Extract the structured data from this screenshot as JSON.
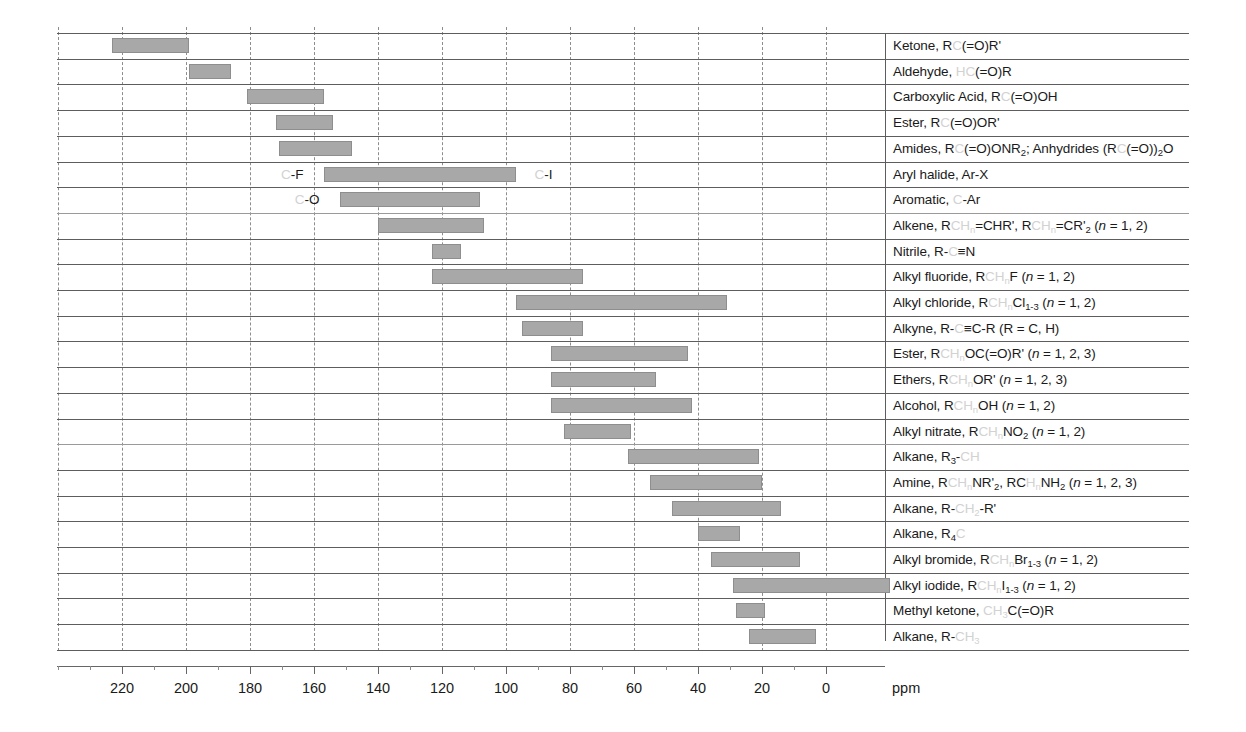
{
  "chart_data": {
    "type": "bar",
    "orientation": "horizontal-range",
    "title": "",
    "xlabel": "ppm",
    "ylabel": "",
    "xlim": [
      240,
      -20
    ],
    "x_axis_reversed": true,
    "grid": true,
    "legend_position": "none",
    "axis_ticks": [
      220,
      200,
      180,
      160,
      140,
      120,
      100,
      80,
      60,
      40,
      20,
      0
    ],
    "axis_tick_labels": [
      "220",
      "200",
      "180",
      "160",
      "140",
      "120",
      "100",
      "80",
      "60",
      "40",
      "20",
      "0"
    ],
    "gridlines_ppm": [
      240,
      220,
      200,
      180,
      160,
      140,
      120,
      100,
      80,
      60,
      40,
      20,
      0
    ],
    "unit_label": "ppm",
    "bar_color": "#a8a8a8",
    "bar_border_color": "#8e8e8e",
    "categories": [
      "Ketone, RC(=O)R'",
      "Aldehyde, HC(=O)R",
      "Carboxylic Acid, RC(=O)OH",
      "Ester, RC(=O)OR'",
      "Amides, RC(=O)ONR2; Anhydrides (RC(=O))2O",
      "Aryl halide, Ar-X",
      "Aromatic, C-Ar",
      "Alkene, RCHn=CHR', RCHn=CR'2 (n = 1, 2)",
      "Nitrile, R-C≡N",
      "Alkyl fluoride, RCHnF (n = 1, 2)",
      "Alkyl chloride, RCHnCl1-3 (n = 1, 2)",
      "Alkyne, R-C≡C-R (R = C, H)",
      "Ester, RCHnOC(=O)R' (n = 1, 2, 3)",
      "Ethers, RCHnOR' (n = 1, 2, 3)",
      "Alcohol, RCHnOH (n = 1, 2)",
      "Alkyl nitrate, RCHnNO2 (n = 1, 2)",
      "Alkane, R3-CH",
      "Amine, RCHnNR'2, RCHnNH2 (n = 1, 2, 3)",
      "Alkane, R-CH2-R'",
      "Alkane, R4C",
      "Alkyl bromide, RCHnBr1-3 (n = 1, 2)",
      "Alkyl iodide, RCHnI1-3 (n = 1, 2)",
      "Methyl ketone, CH3C(=O)R",
      "Alkane, R-CH3"
    ],
    "ranges_ppm": [
      [
        223,
        199
      ],
      [
        199,
        186
      ],
      [
        181,
        157
      ],
      [
        172,
        154
      ],
      [
        171,
        148
      ],
      [
        157,
        97
      ],
      [
        152,
        108
      ],
      [
        140,
        107
      ],
      [
        123,
        114
      ],
      [
        123,
        76
      ],
      [
        97,
        31
      ],
      [
        95,
        76
      ],
      [
        86,
        43
      ],
      [
        86,
        53
      ],
      [
        86,
        42
      ],
      [
        82,
        61
      ],
      [
        62,
        21
      ],
      [
        55,
        20
      ],
      [
        48,
        14
      ],
      [
        40,
        27
      ],
      [
        36,
        8
      ],
      [
        29,
        -20
      ],
      [
        28,
        19
      ],
      [
        24,
        3
      ]
    ]
  },
  "rows": [
    {
      "id": "ketone",
      "parts": [
        {
          "t": "Ketone, R",
          "f": 0
        },
        {
          "t": "C",
          "f": 1
        },
        {
          "t": "(=O)R'",
          "f": 0
        }
      ]
    },
    {
      "id": "aldehyde",
      "parts": [
        {
          "t": "Aldehyde, ",
          "f": 0
        },
        {
          "t": "HC",
          "f": 1
        },
        {
          "t": "(=O)R",
          "f": 0
        }
      ]
    },
    {
      "id": "carboxylic-acid",
      "parts": [
        {
          "t": "Carboxylic Acid, R",
          "f": 0
        },
        {
          "t": "C",
          "f": 1
        },
        {
          "t": "(=O)OH",
          "f": 0
        }
      ]
    },
    {
      "id": "ester-carbonyl",
      "parts": [
        {
          "t": "Ester, R",
          "f": 0
        },
        {
          "t": "C",
          "f": 1
        },
        {
          "t": "(=O)OR'",
          "f": 0
        }
      ]
    },
    {
      "id": "amides-anhydrides",
      "parts": [
        {
          "t": "Amides, R",
          "f": 0
        },
        {
          "t": "C",
          "f": 1
        },
        {
          "t": "(=O)ONR",
          "f": 0
        },
        {
          "t": "2",
          "f": 0,
          "sub": 1
        },
        {
          "t": "; Anhydrides (R",
          "f": 0
        },
        {
          "t": "C",
          "f": 1
        },
        {
          "t": "(=O))",
          "f": 0
        },
        {
          "t": "2",
          "f": 0,
          "sub": 1
        },
        {
          "t": "O",
          "f": 0
        }
      ]
    },
    {
      "id": "aryl-halide",
      "parts": [
        {
          "t": "Aryl halide, Ar-X",
          "f": 0
        }
      ]
    },
    {
      "id": "aromatic",
      "parts": [
        {
          "t": "Aromatic, ",
          "f": 0
        },
        {
          "t": "C",
          "f": 1
        },
        {
          "t": "-Ar",
          "f": 0
        }
      ]
    },
    {
      "id": "alkene",
      "parts": [
        {
          "t": "Alkene, R",
          "f": 0
        },
        {
          "t": "CH",
          "f": 1
        },
        {
          "t": "n",
          "f": 1,
          "sub": 1
        },
        {
          "t": "=CHR', R",
          "f": 0
        },
        {
          "t": "CH",
          "f": 1
        },
        {
          "t": "n",
          "f": 1,
          "sub": 1
        },
        {
          "t": "=CR'",
          "f": 0
        },
        {
          "t": "2",
          "f": 0,
          "sub": 1
        },
        {
          "t": " (",
          "f": 0
        },
        {
          "t": "n",
          "f": 0,
          "ital": 1
        },
        {
          "t": " = 1, 2)",
          "f": 0
        }
      ]
    },
    {
      "id": "nitrile",
      "parts": [
        {
          "t": "Nitrile, R-",
          "f": 0
        },
        {
          "t": "C",
          "f": 1
        },
        {
          "t": "≡N",
          "f": 0
        }
      ]
    },
    {
      "id": "alkyl-fluoride",
      "parts": [
        {
          "t": "Alkyl fluoride, R",
          "f": 0
        },
        {
          "t": "CH",
          "f": 1
        },
        {
          "t": "n",
          "f": 1,
          "sub": 1
        },
        {
          "t": "F (",
          "f": 0
        },
        {
          "t": "n",
          "f": 0,
          "ital": 1
        },
        {
          "t": " = 1, 2)",
          "f": 0
        }
      ]
    },
    {
      "id": "alkyl-chloride",
      "parts": [
        {
          "t": "Alkyl chloride, R",
          "f": 0
        },
        {
          "t": "CH",
          "f": 1
        },
        {
          "t": "n",
          "f": 1,
          "sub": 1
        },
        {
          "t": "Cl",
          "f": 0
        },
        {
          "t": "1-3",
          "f": 0,
          "sub": 1
        },
        {
          "t": " (",
          "f": 0
        },
        {
          "t": "n",
          "f": 0,
          "ital": 1
        },
        {
          "t": " = 1, 2)",
          "f": 0
        }
      ]
    },
    {
      "id": "alkyne",
      "parts": [
        {
          "t": "Alkyne, R-",
          "f": 0
        },
        {
          "t": "C",
          "f": 1
        },
        {
          "t": "≡C-R (R = C, H)",
          "f": 0
        }
      ]
    },
    {
      "id": "ester-alkyl",
      "parts": [
        {
          "t": "Ester, R",
          "f": 0
        },
        {
          "t": "CH",
          "f": 1
        },
        {
          "t": "n",
          "f": 1,
          "sub": 1
        },
        {
          "t": "OC(=O)R' (",
          "f": 0
        },
        {
          "t": "n",
          "f": 0,
          "ital": 1
        },
        {
          "t": " = 1, 2, 3)",
          "f": 0
        }
      ]
    },
    {
      "id": "ethers",
      "parts": [
        {
          "t": "Ethers, R",
          "f": 0
        },
        {
          "t": "CH",
          "f": 1
        },
        {
          "t": "n",
          "f": 1,
          "sub": 1
        },
        {
          "t": "OR' (",
          "f": 0
        },
        {
          "t": "n",
          "f": 0,
          "ital": 1
        },
        {
          "t": " = 1, 2, 3)",
          "f": 0
        }
      ]
    },
    {
      "id": "alcohol",
      "parts": [
        {
          "t": "Alcohol, R",
          "f": 0
        },
        {
          "t": "CH",
          "f": 1
        },
        {
          "t": "n",
          "f": 1,
          "sub": 1
        },
        {
          "t": "OH (",
          "f": 0
        },
        {
          "t": "n",
          "f": 0,
          "ital": 1
        },
        {
          "t": " = 1, 2)",
          "f": 0
        }
      ]
    },
    {
      "id": "alkyl-nitrate",
      "parts": [
        {
          "t": "Alkyl nitrate, R",
          "f": 0
        },
        {
          "t": "CH",
          "f": 1
        },
        {
          "t": "n",
          "f": 1,
          "sub": 1
        },
        {
          "t": "NO",
          "f": 0
        },
        {
          "t": "2",
          "f": 0,
          "sub": 1
        },
        {
          "t": " (",
          "f": 0
        },
        {
          "t": "n",
          "f": 0,
          "ital": 1
        },
        {
          "t": " = 1, 2)",
          "f": 0
        }
      ]
    },
    {
      "id": "alkane-r3ch",
      "parts": [
        {
          "t": "Alkane, R",
          "f": 0
        },
        {
          "t": "3",
          "f": 0,
          "sub": 1
        },
        {
          "t": "-",
          "f": 0
        },
        {
          "t": "CH",
          "f": 1
        }
      ]
    },
    {
      "id": "amine",
      "parts": [
        {
          "t": "Amine, R",
          "f": 0
        },
        {
          "t": "CH",
          "f": 1
        },
        {
          "t": "n",
          "f": 1,
          "sub": 1
        },
        {
          "t": "NR'",
          "f": 0
        },
        {
          "t": "2",
          "f": 0,
          "sub": 1
        },
        {
          "t": ", RC",
          "f": 0
        },
        {
          "t": "H",
          "f": 1
        },
        {
          "t": "n",
          "f": 1,
          "sub": 1
        },
        {
          "t": "NH",
          "f": 0
        },
        {
          "t": "2",
          "f": 0,
          "sub": 1
        },
        {
          "t": " (",
          "f": 0
        },
        {
          "t": "n",
          "f": 0,
          "ital": 1
        },
        {
          "t": " = 1, 2, 3)",
          "f": 0
        }
      ]
    },
    {
      "id": "alkane-rch2r",
      "parts": [
        {
          "t": "Alkane, R-",
          "f": 0
        },
        {
          "t": "CH",
          "f": 1
        },
        {
          "t": "2",
          "f": 1,
          "sub": 1
        },
        {
          "t": "-R'",
          "f": 0
        }
      ]
    },
    {
      "id": "alkane-r4c",
      "parts": [
        {
          "t": "Alkane, R",
          "f": 0
        },
        {
          "t": "4",
          "f": 0,
          "sub": 1
        },
        {
          "t": "C",
          "f": 1
        }
      ]
    },
    {
      "id": "alkyl-bromide",
      "parts": [
        {
          "t": "Alkyl bromide, R",
          "f": 0
        },
        {
          "t": "CH",
          "f": 1
        },
        {
          "t": "n",
          "f": 1,
          "sub": 1
        },
        {
          "t": "Br",
          "f": 0
        },
        {
          "t": "1-3",
          "f": 0,
          "sub": 1
        },
        {
          "t": " (",
          "f": 0
        },
        {
          "t": "n",
          "f": 0,
          "ital": 1
        },
        {
          "t": " = 1, 2)",
          "f": 0
        }
      ]
    },
    {
      "id": "alkyl-iodide",
      "parts": [
        {
          "t": "Alkyl iodide, R",
          "f": 0
        },
        {
          "t": "CH",
          "f": 1
        },
        {
          "t": "n",
          "f": 1,
          "sub": 1
        },
        {
          "t": "I",
          "f": 0
        },
        {
          "t": "1-3",
          "f": 0,
          "sub": 1
        },
        {
          "t": " (",
          "f": 0
        },
        {
          "t": "n",
          "f": 0,
          "ital": 1
        },
        {
          "t": " = 1, 2)",
          "f": 0
        }
      ]
    },
    {
      "id": "methyl-ketone",
      "parts": [
        {
          "t": "Methyl ketone, ",
          "f": 0
        },
        {
          "t": "CH",
          "f": 1
        },
        {
          "t": "3",
          "f": 1,
          "sub": 1
        },
        {
          "t": "C(=O)R",
          "f": 0
        }
      ]
    },
    {
      "id": "alkane-rch3",
      "parts": [
        {
          "t": "Alkane, R-",
          "f": 0
        },
        {
          "t": "CH",
          "f": 1
        },
        {
          "t": "3",
          "f": 1,
          "sub": 1
        }
      ]
    }
  ],
  "annotations": [
    {
      "id": "c-f-annot",
      "row": 5,
      "ppm": 162,
      "align": "right",
      "parts": [
        {
          "t": "C",
          "f": 1
        },
        {
          "t": "-F",
          "f": 0
        }
      ]
    },
    {
      "id": "c-i-annot",
      "row": 5,
      "ppm": 93,
      "align": "left",
      "parts": [
        {
          "t": "C",
          "f": 1
        },
        {
          "t": "-I",
          "f": 0
        }
      ]
    },
    {
      "id": "c-o-annot",
      "row": 6,
      "ppm": 157,
      "align": "right",
      "parts": [
        {
          "t": "C",
          "f": 1
        },
        {
          "t": "-O",
          "f": 0
        }
      ]
    }
  ],
  "layout": {
    "label_column_ppm": 0,
    "label_column_x_px": 885,
    "plot_left_px": 57,
    "plot_top_px": 33,
    "plot_width_px": 1132,
    "row_height_px": 25.7,
    "row_count": 24
  }
}
